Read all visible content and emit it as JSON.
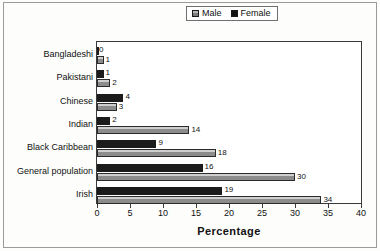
{
  "chart_data": {
    "type": "bar",
    "orientation": "horizontal",
    "title": "",
    "xlabel": "Percentage",
    "ylabel": "",
    "xlim": [
      0,
      40
    ],
    "xticks": [
      0,
      5,
      10,
      15,
      20,
      25,
      30,
      35,
      40
    ],
    "grid": false,
    "legend_position": "top-center",
    "categories": [
      "Bangladeshi",
      "Pakistani",
      "Chinese",
      "Indian",
      "Black Caribbean",
      "General population",
      "Irish"
    ],
    "series": [
      {
        "name": "Male",
        "color": "#9a9a9a",
        "values": [
          1,
          2,
          3,
          14,
          18,
          30,
          34
        ],
        "labels": [
          "1",
          "2",
          "3",
          "14",
          "18",
          "30",
          "34"
        ]
      },
      {
        "name": "Female",
        "color": "#1b1b1b",
        "values": [
          0,
          1,
          4,
          2,
          9,
          16,
          19
        ],
        "labels": [
          "0",
          "1",
          "4",
          "2",
          "9",
          "16",
          "19"
        ]
      }
    ]
  },
  "legend": {
    "entries": [
      {
        "label": "Male",
        "swatch": "gray-hatched-square-icon"
      },
      {
        "label": "Female",
        "swatch": "black-square-icon"
      }
    ]
  },
  "axis": {
    "x_title": "Percentage",
    "x_tick_labels": [
      "0",
      "5",
      "10",
      "15",
      "20",
      "25",
      "30",
      "35",
      "40"
    ]
  }
}
